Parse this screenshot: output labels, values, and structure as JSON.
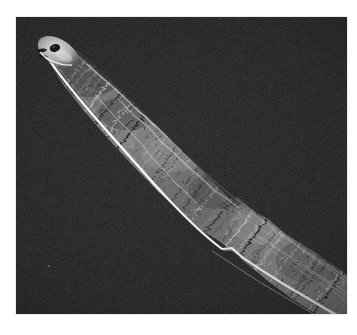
{
  "image": {
    "kind": "scanning-electron-micrograph",
    "subject": "tapered fibrous specimen tip",
    "orientation": "diagonal, tip at upper-left, body exiting lower-right edge",
    "caption": "",
    "width_px": 357,
    "height_px": 335
  },
  "frame": {
    "paper_color": "#ffffff",
    "panel_color": "#050505",
    "panel_left": 16,
    "panel_top": 17,
    "panel_width": 331,
    "panel_height": 297
  },
  "palette": {
    "background_black": "#050505",
    "background_noise": "#141414",
    "specimen_dark": "#1b1b1b",
    "specimen_mid": "#6e6e6e",
    "specimen_light": "#bdbdbd",
    "edge_highlight": "#f2f2f2",
    "tip_highlight": "#e8e8e8",
    "eye_spot_dark": "#101010"
  },
  "specimen": {
    "tip_label": "rounded tip cap",
    "tip_x": 42,
    "tip_y": 52,
    "eye_spot_label": "dark oval pit near tip",
    "eye_spot_x": 50,
    "eye_spot_y": 51,
    "notch_label": "step notch in lower contour",
    "notch_x": 216,
    "notch_y": 231,
    "edge_highlight_label": "bright specular rim along lower edge",
    "texture_label": "chevron fibrous striations",
    "striation_count": 58,
    "fiber_bundle_count": 26,
    "speck_x": 48,
    "speck_y": 265
  },
  "annotations": {
    "scale_bar": "",
    "magnification": "",
    "instrument_text": ""
  }
}
